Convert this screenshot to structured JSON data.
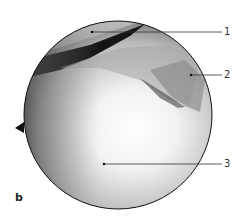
{
  "figure": {
    "panel_label": "b",
    "labels": [
      {
        "id": "1",
        "text": "1"
      },
      {
        "id": "2",
        "text": "2"
      },
      {
        "id": "3",
        "text": "3"
      }
    ],
    "colors": {
      "leader_line": "#333333",
      "circle_border": "#111111"
    }
  }
}
